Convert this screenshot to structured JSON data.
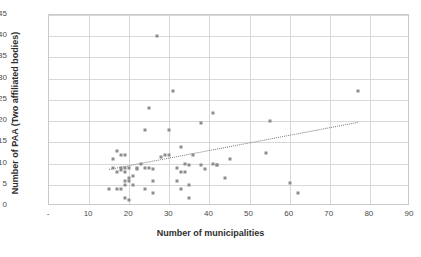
{
  "chart_data": {
    "type": "scatter",
    "title": "",
    "xlabel": "Number of municipalities",
    "ylabel": "Number of PAA (Two affiliated bodies)",
    "xlim": [
      0,
      90
    ],
    "ylim": [
      0,
      45
    ],
    "xticks": [
      "-",
      "10",
      "20",
      "30",
      "40",
      "50",
      "60",
      "70",
      "80",
      "90"
    ],
    "xtick_values": [
      0,
      10,
      20,
      30,
      40,
      50,
      60,
      70,
      80,
      90
    ],
    "yticks": [
      "0",
      "5",
      "10",
      "15",
      "20",
      "25",
      "30",
      "35",
      "40",
      "45"
    ],
    "ytick_values": [
      0,
      5,
      10,
      15,
      20,
      25,
      30,
      35,
      40,
      45
    ],
    "grid": true,
    "legend": "none",
    "marker_color": "#8d8d8d",
    "marker_shape": "square",
    "gridline_color": "#d8d8d8",
    "frame_color": "#c9c9c9",
    "points": [
      [
        15,
        4
      ],
      [
        16,
        9
      ],
      [
        16,
        11
      ],
      [
        17,
        13
      ],
      [
        17,
        8
      ],
      [
        17,
        4
      ],
      [
        18,
        12
      ],
      [
        18,
        9
      ],
      [
        18,
        8.5
      ],
      [
        18,
        4
      ],
      [
        19,
        12
      ],
      [
        19,
        9
      ],
      [
        19,
        8
      ],
      [
        19,
        6
      ],
      [
        19,
        5
      ],
      [
        19,
        2
      ],
      [
        20,
        9
      ],
      [
        20,
        6
      ],
      [
        20,
        6.5
      ],
      [
        20,
        1.5
      ],
      [
        21,
        7
      ],
      [
        21,
        5
      ],
      [
        22,
        9
      ],
      [
        22,
        8.7
      ],
      [
        23,
        10
      ],
      [
        24,
        18
      ],
      [
        24,
        9
      ],
      [
        24,
        4
      ],
      [
        25,
        23
      ],
      [
        25,
        9
      ],
      [
        26,
        8.7
      ],
      [
        26,
        6
      ],
      [
        26,
        3
      ],
      [
        27,
        40
      ],
      [
        28,
        11.5
      ],
      [
        29,
        12
      ],
      [
        30,
        12
      ],
      [
        30,
        18
      ],
      [
        31,
        27
      ],
      [
        32,
        9
      ],
      [
        32,
        6
      ],
      [
        33,
        14
      ],
      [
        33,
        8
      ],
      [
        33,
        4
      ],
      [
        34,
        10
      ],
      [
        34,
        8
      ],
      [
        35,
        9.7
      ],
      [
        35,
        5
      ],
      [
        35,
        2
      ],
      [
        36,
        12
      ],
      [
        38,
        19.5
      ],
      [
        38,
        9.7
      ],
      [
        39,
        8.7
      ],
      [
        41,
        22
      ],
      [
        41,
        10
      ],
      [
        42,
        9.7
      ],
      [
        42,
        9.7
      ],
      [
        44,
        6.7
      ],
      [
        45,
        11
      ],
      [
        54,
        12.5
      ],
      [
        55,
        20
      ],
      [
        60,
        5.5
      ],
      [
        62,
        3
      ],
      [
        77,
        27
      ]
    ],
    "trendline": {
      "visible": true,
      "style": "dotted",
      "x_start": 15,
      "y_start": 8.7,
      "x_end": 77,
      "y_end": 19.8
    }
  }
}
